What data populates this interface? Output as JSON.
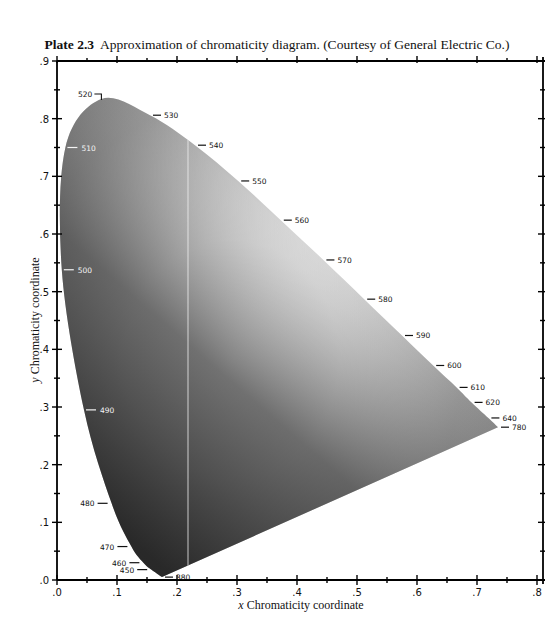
{
  "caption": {
    "plate": "Plate 2.3",
    "text": "Approximation of chromaticity diagram. (Courtesy of General Electric Co.)"
  },
  "chart_data": {
    "type": "area",
    "xlabel": "x Chromaticity coordinate",
    "ylabel": "y Chromaticity coordinate",
    "xlim": [
      0,
      0.8
    ],
    "ylim": [
      0,
      0.9
    ],
    "x_ticks": [
      ".0",
      ".1",
      ".2",
      ".3",
      ".4",
      ".5",
      ".6",
      ".7",
      ".8"
    ],
    "y_ticks": [
      ".0",
      ".1",
      ".2",
      ".3",
      ".4",
      ".5",
      ".6",
      ".7",
      ".8",
      ".9"
    ],
    "grid": false,
    "spectral_locus": [
      {
        "nm": "380",
        "x": 0.175,
        "y": 0.005
      },
      {
        "nm": "450",
        "x": 0.157,
        "y": 0.018
      },
      {
        "nm": "460",
        "x": 0.144,
        "y": 0.03
      },
      {
        "nm": "470",
        "x": 0.124,
        "y": 0.058
      },
      {
        "nm": "480",
        "x": 0.091,
        "y": 0.133
      },
      {
        "nm": "490",
        "x": 0.045,
        "y": 0.295
      },
      {
        "nm": "500",
        "x": 0.008,
        "y": 0.538
      },
      {
        "nm": "510",
        "x": 0.014,
        "y": 0.75
      },
      {
        "nm": "520",
        "x": 0.074,
        "y": 0.834
      },
      {
        "nm": "530",
        "x": 0.155,
        "y": 0.806
      },
      {
        "nm": "540",
        "x": 0.23,
        "y": 0.754
      },
      {
        "nm": "550",
        "x": 0.302,
        "y": 0.692
      },
      {
        "nm": "560",
        "x": 0.373,
        "y": 0.624
      },
      {
        "nm": "570",
        "x": 0.444,
        "y": 0.555
      },
      {
        "nm": "580",
        "x": 0.512,
        "y": 0.487
      },
      {
        "nm": "590",
        "x": 0.575,
        "y": 0.424
      },
      {
        "nm": "600",
        "x": 0.627,
        "y": 0.372
      },
      {
        "nm": "610",
        "x": 0.666,
        "y": 0.334
      },
      {
        "nm": "620",
        "x": 0.691,
        "y": 0.308
      },
      {
        "nm": "640",
        "x": 0.719,
        "y": 0.281
      },
      {
        "nm": "780",
        "x": 0.735,
        "y": 0.265
      }
    ],
    "annotations": "Wavelength labels (nm) along the spectral locus; interior shaded in grayscale, brightest near white point (~0.31, 0.32)"
  },
  "axes": {
    "x_title": "x Chromaticity coordinate",
    "y_title": "y Chromaticity coordinate"
  }
}
